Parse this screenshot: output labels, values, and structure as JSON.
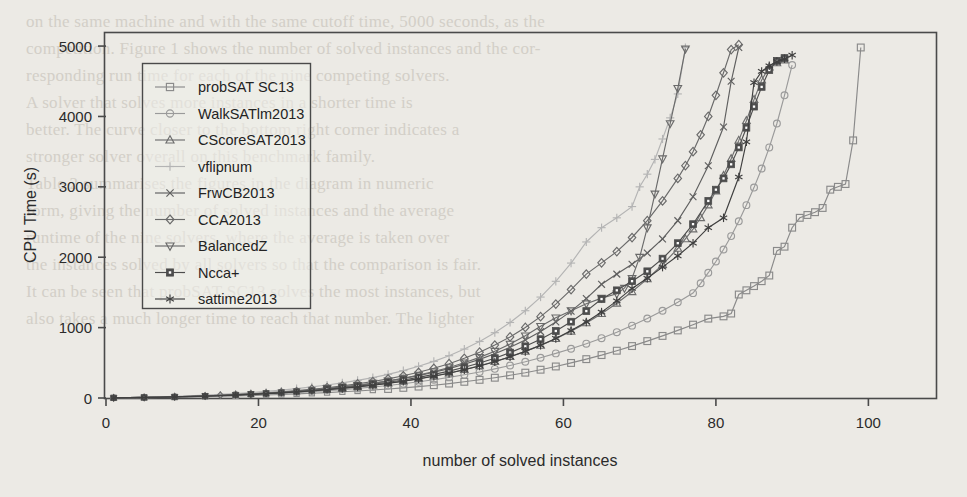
{
  "figure": {
    "background_color": "#eceae5",
    "frame_color": "#4a4a4a"
  },
  "chart_data": {
    "type": "line",
    "title": "",
    "xlabel": "number of solved instances",
    "ylabel": "CPU Time (s)",
    "xlim": [
      0,
      109
    ],
    "ylim": [
      0,
      5200
    ],
    "xticks": [
      0,
      20,
      40,
      60,
      80,
      100
    ],
    "yticks": [
      0,
      1000,
      2000,
      3000,
      4000,
      5000
    ],
    "xtick_labels": [
      "0",
      "20",
      "40",
      "60",
      "80",
      "100"
    ],
    "ytick_labels": [
      "0",
      "1000",
      "2000",
      "3000",
      "4000",
      "5000"
    ],
    "grid": false,
    "legend_position": "upper left",
    "series": [
      {
        "name": "probSAT SC13",
        "marker": "square",
        "color": "#8a8a8a",
        "x": [
          1,
          3,
          5,
          7,
          9,
          11,
          13,
          15,
          17,
          19,
          21,
          23,
          25,
          27,
          29,
          31,
          33,
          35,
          37,
          39,
          41,
          43,
          45,
          47,
          49,
          51,
          53,
          55,
          57,
          59,
          61,
          63,
          65,
          67,
          69,
          71,
          73,
          75,
          77,
          79,
          81,
          82,
          83,
          84,
          85,
          86,
          87,
          88,
          89,
          90,
          91,
          92,
          93,
          94,
          95,
          96,
          97,
          98,
          99
        ],
        "y": [
          2,
          4,
          6,
          9,
          12,
          16,
          20,
          25,
          30,
          36,
          42,
          50,
          58,
          67,
          77,
          88,
          100,
          113,
          128,
          144,
          162,
          182,
          205,
          230,
          258,
          288,
          322,
          360,
          402,
          448,
          498,
          552,
          610,
          672,
          738,
          808,
          882,
          960,
          1042,
          1128,
          1160,
          1200,
          1470,
          1530,
          1590,
          1660,
          1740,
          2090,
          2150,
          2420,
          2560,
          2600,
          2640,
          2700,
          2960,
          3000,
          3040,
          3660,
          4980
        ]
      },
      {
        "name": "WalkSATlm2013",
        "marker": "circle",
        "color": "#9a9a9a",
        "x": [
          1,
          3,
          5,
          7,
          9,
          11,
          13,
          15,
          17,
          19,
          21,
          23,
          25,
          27,
          29,
          31,
          33,
          35,
          37,
          39,
          41,
          43,
          45,
          47,
          49,
          51,
          53,
          55,
          57,
          59,
          61,
          63,
          65,
          67,
          69,
          71,
          73,
          75,
          77,
          78,
          79,
          80,
          81,
          82,
          83,
          84,
          85,
          86,
          87,
          88,
          89,
          90
        ],
        "y": [
          2,
          4,
          7,
          10,
          14,
          19,
          24,
          30,
          37,
          45,
          54,
          64,
          75,
          88,
          102,
          118,
          136,
          156,
          178,
          203,
          230,
          260,
          293,
          330,
          370,
          414,
          462,
          515,
          572,
          634,
          700,
          772,
          850,
          935,
          1028,
          1130,
          1240,
          1360,
          1490,
          1630,
          1780,
          1940,
          2110,
          2300,
          2510,
          2740,
          2990,
          3260,
          3560,
          3900,
          4300,
          4730
        ]
      },
      {
        "name": "CScoreSAT2013",
        "marker": "triangle-up",
        "color": "#6e6e6e",
        "x": [
          1,
          3,
          5,
          7,
          9,
          11,
          13,
          15,
          17,
          19,
          21,
          23,
          25,
          27,
          29,
          31,
          33,
          35,
          37,
          39,
          41,
          43,
          45,
          47,
          49,
          51,
          53,
          55,
          57,
          59,
          61,
          63,
          65,
          67,
          69,
          71,
          73,
          75,
          76,
          77,
          78,
          79,
          80,
          81,
          82,
          83,
          84,
          85,
          86,
          87,
          88,
          89
        ],
        "y": [
          2,
          5,
          8,
          12,
          17,
          22,
          28,
          35,
          43,
          52,
          62,
          74,
          87,
          102,
          119,
          138,
          159,
          183,
          210,
          240,
          274,
          312,
          355,
          403,
          457,
          518,
          586,
          662,
          747,
          842,
          948,
          1066,
          1198,
          1345,
          1509,
          1692,
          1896,
          2124,
          2260,
          2400,
          2560,
          2740,
          2940,
          3160,
          3400,
          3660,
          3940,
          4240,
          4520,
          4700,
          4760,
          4800
        ]
      },
      {
        "name": "vflipnum",
        "marker": "plus",
        "color": "#b4b4b4",
        "x": [
          1,
          3,
          5,
          7,
          9,
          11,
          13,
          15,
          17,
          19,
          21,
          23,
          25,
          27,
          29,
          31,
          33,
          35,
          37,
          39,
          41,
          43,
          45,
          47,
          49,
          51,
          53,
          55,
          57,
          59,
          61,
          63,
          65,
          67,
          69,
          70,
          71,
          72,
          73,
          74,
          75,
          76
        ],
        "y": [
          3,
          7,
          12,
          18,
          25,
          33,
          42,
          52,
          64,
          78,
          94,
          112,
          133,
          157,
          184,
          215,
          250,
          290,
          336,
          389,
          450,
          520,
          601,
          695,
          803,
          928,
          1073,
          1240,
          1434,
          1658,
          1917,
          2217,
          2420,
          2560,
          2720,
          3000,
          3180,
          3390,
          3680,
          3980,
          4320,
          4980
        ]
      },
      {
        "name": "FrwCB2013",
        "marker": "cross",
        "color": "#5f5f5f",
        "x": [
          1,
          3,
          5,
          7,
          9,
          11,
          13,
          15,
          17,
          19,
          21,
          23,
          25,
          27,
          29,
          31,
          33,
          35,
          37,
          39,
          41,
          43,
          45,
          47,
          49,
          51,
          53,
          55,
          57,
          59,
          61,
          63,
          65,
          67,
          69,
          71,
          73,
          75,
          77,
          79,
          81,
          82,
          83
        ],
        "y": [
          2,
          5,
          9,
          13,
          18,
          24,
          31,
          39,
          48,
          58,
          70,
          83,
          98,
          115,
          134,
          156,
          181,
          209,
          241,
          277,
          318,
          365,
          418,
          479,
          549,
          629,
          720,
          824,
          943,
          1079,
          1234,
          1412,
          1615,
          1760,
          1900,
          2060,
          2260,
          2520,
          2860,
          3300,
          3850,
          4500,
          4980
        ]
      },
      {
        "name": "CCA2013",
        "marker": "diamond",
        "color": "#6a6a6a",
        "x": [
          1,
          3,
          5,
          7,
          9,
          11,
          13,
          15,
          17,
          19,
          21,
          23,
          25,
          27,
          29,
          31,
          33,
          35,
          37,
          39,
          41,
          43,
          45,
          47,
          49,
          51,
          53,
          55,
          57,
          59,
          61,
          63,
          65,
          67,
          69,
          71,
          73,
          75,
          76,
          77,
          78,
          79,
          80,
          81,
          82,
          83
        ],
        "y": [
          2,
          5,
          9,
          13,
          18,
          24,
          31,
          40,
          50,
          61,
          74,
          89,
          106,
          125,
          147,
          172,
          201,
          234,
          272,
          315,
          365,
          422,
          488,
          564,
          651,
          752,
          868,
          1002,
          1156,
          1334,
          1540,
          1760,
          1920,
          2080,
          2280,
          2520,
          2800,
          3120,
          3300,
          3500,
          3740,
          4000,
          4300,
          4620,
          4950,
          5020
        ]
      },
      {
        "name": "BalancedZ",
        "marker": "triangle-down",
        "color": "#6a6a6a",
        "x": [
          1,
          3,
          5,
          7,
          9,
          11,
          13,
          15,
          17,
          19,
          21,
          23,
          25,
          27,
          29,
          31,
          33,
          35,
          37,
          39,
          41,
          43,
          45,
          47,
          49,
          51,
          53,
          55,
          57,
          59,
          61,
          63,
          65,
          67,
          68,
          69,
          70,
          71,
          72,
          73,
          74,
          75,
          76
        ],
        "y": [
          2,
          5,
          8,
          12,
          17,
          23,
          29,
          37,
          46,
          56,
          68,
          81,
          96,
          113,
          133,
          155,
          181,
          210,
          243,
          281,
          325,
          375,
          433,
          500,
          577,
          665,
          767,
          884,
          1019,
          1140,
          1240,
          1340,
          1420,
          1480,
          1560,
          1700,
          2000,
          2420,
          2900,
          3400,
          3900,
          4400,
          4960
        ]
      },
      {
        "name": "Ncca+",
        "marker": "square-filled",
        "color": "#4d4d4d",
        "x": [
          1,
          3,
          5,
          7,
          9,
          11,
          13,
          15,
          17,
          19,
          21,
          23,
          25,
          27,
          29,
          31,
          33,
          35,
          37,
          39,
          41,
          43,
          45,
          47,
          49,
          51,
          53,
          55,
          57,
          59,
          61,
          63,
          65,
          67,
          69,
          71,
          73,
          75,
          77,
          79,
          80,
          81,
          82,
          83,
          84,
          85,
          86,
          87,
          88,
          89
        ],
        "y": [
          2,
          5,
          8,
          12,
          17,
          22,
          28,
          36,
          44,
          54,
          65,
          77,
          91,
          107,
          125,
          145,
          168,
          194,
          223,
          256,
          293,
          335,
          382,
          436,
          497,
          566,
          645,
          734,
          836,
          952,
          1084,
          1235,
          1406,
          1530,
          1660,
          1800,
          1980,
          2200,
          2470,
          2800,
          2960,
          3120,
          3320,
          3560,
          3840,
          4140,
          4420,
          4660,
          4790,
          4830
        ]
      },
      {
        "name": "sattime2013",
        "marker": "asterisk",
        "color": "#3f3f3f",
        "x": [
          1,
          3,
          5,
          7,
          9,
          11,
          13,
          15,
          17,
          19,
          21,
          23,
          25,
          27,
          29,
          31,
          33,
          35,
          37,
          39,
          41,
          43,
          45,
          47,
          49,
          51,
          53,
          55,
          57,
          59,
          61,
          63,
          65,
          67,
          69,
          71,
          73,
          75,
          77,
          79,
          81,
          83,
          84,
          85,
          86,
          87,
          88,
          89,
          90
        ],
        "y": [
          2,
          4,
          7,
          11,
          15,
          20,
          26,
          33,
          41,
          50,
          60,
          72,
          85,
          100,
          117,
          136,
          157,
          181,
          208,
          238,
          272,
          310,
          353,
          401,
          455,
          516,
          585,
          662,
          749,
          847,
          957,
          1081,
          1221,
          1379,
          1557,
          1700,
          1860,
          2020,
          2200,
          2420,
          2560,
          3140,
          3640,
          4480,
          4640,
          4720,
          4780,
          4820,
          4870
        ]
      }
    ]
  },
  "legend": {
    "items": [
      {
        "label": "probSAT SC13",
        "marker": "square",
        "color": "#8a8a8a"
      },
      {
        "label": "WalkSATlm2013",
        "marker": "circle",
        "color": "#9a9a9a"
      },
      {
        "label": "CScoreSAT2013",
        "marker": "triangle-up",
        "color": "#6e6e6e"
      },
      {
        "label": "vflipnum",
        "marker": "plus",
        "color": "#b4b4b4"
      },
      {
        "label": "FrwCB2013",
        "marker": "cross",
        "color": "#5f5f5f"
      },
      {
        "label": "CCA2013",
        "marker": "diamond",
        "color": "#6a6a6a"
      },
      {
        "label": "BalancedZ",
        "marker": "triangle-down",
        "color": "#6a6a6a"
      },
      {
        "label": "Ncca+",
        "marker": "square-filled",
        "color": "#4d4d4d"
      },
      {
        "label": "sattime2013",
        "marker": "asterisk",
        "color": "#3f3f3f"
      }
    ]
  },
  "background_text": {
    "lines": [
      "on the same machine and with the same cutoff time, 5000 seconds, as the",
      "competition. Figure 1 shows the number of solved instances and the cor-",
      "responding run time for each of the nine competing solvers.",
      "A solver that solves more instances in a shorter time is",
      "better. The curve closer to the bottom right corner indicates a",
      "stronger solver overall on this benchmark family.",
      "Table 2 summarises the figures in the diagram in numeric",
      "form, giving the number of solved instances and the average",
      "runtime of the nine solvers, where the average is taken over",
      "the instances solved by all solvers so that the comparison is fair.",
      "It can be seen that probSAT SC13 solves the most instances, but",
      "also takes a much longer time to reach that number. The lighter"
    ]
  }
}
